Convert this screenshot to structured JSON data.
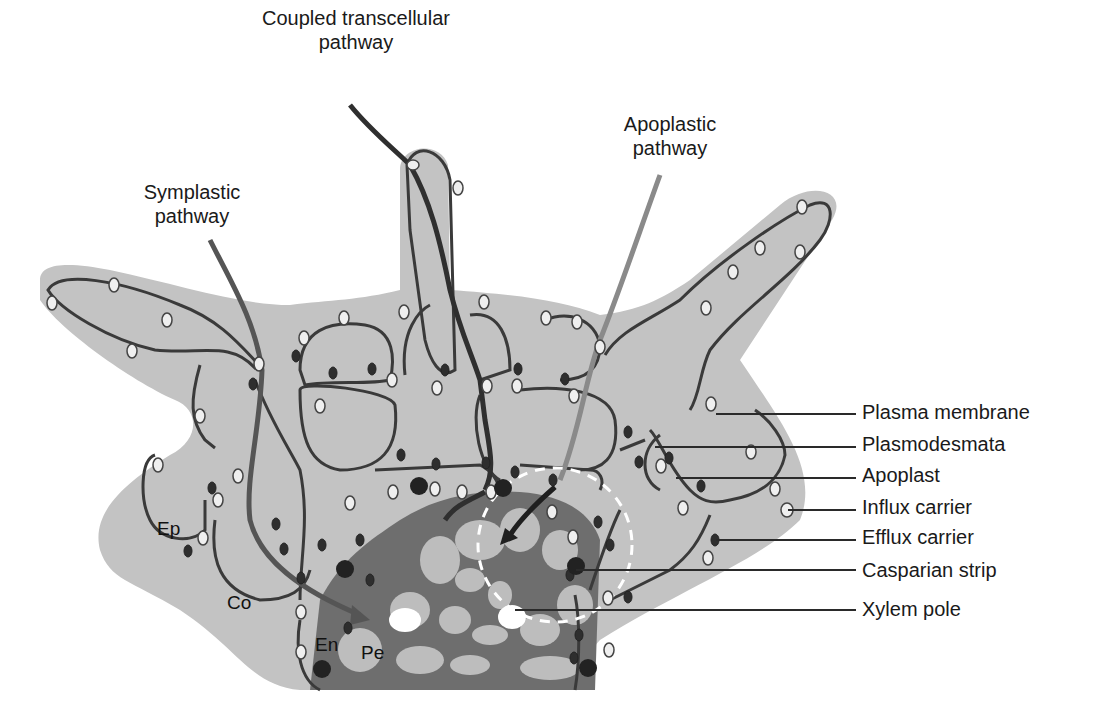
{
  "title_labels": {
    "coupled": {
      "line1": "Coupled transcellular",
      "line2": "pathway"
    },
    "apoplastic": {
      "line1": "Apoplastic",
      "line2": "pathway"
    },
    "symplastic": {
      "line1": "Symplastic",
      "line2": "pathway"
    }
  },
  "legend": {
    "items": [
      {
        "label": "Plasma membrane"
      },
      {
        "label": "Plasmodesmata"
      },
      {
        "label": "Apoplast"
      },
      {
        "label": "Influx carrier"
      },
      {
        "label": "Efflux carrier"
      },
      {
        "label": "Casparian strip"
      },
      {
        "label": "Xylem pole"
      }
    ]
  },
  "tissue_labels": {
    "epidermis": "Ep",
    "cortex": "Co",
    "endodermis": "En",
    "pericycle": "Pe"
  },
  "colors": {
    "background": "#ffffff",
    "tissue_fill": "#c3c3c3",
    "cell_wall": "#3a3a3a",
    "stele": "#6e6e6e",
    "stele_cells": "#bdbdbd",
    "coupled_path": "#2f2f2f",
    "symplastic_path": "#555555",
    "apoplastic_path": "#8a8a8a",
    "xylem": "#ffffff"
  }
}
